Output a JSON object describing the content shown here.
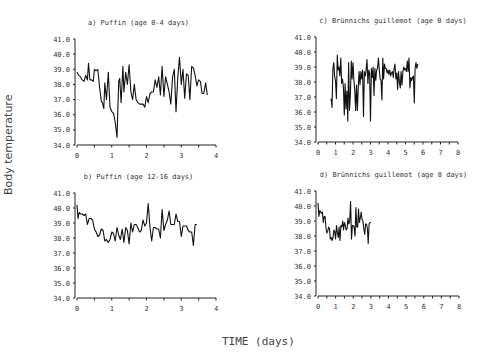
{
  "figure": {
    "ylabel": "Body temperature",
    "xlabel": "TIME (days)"
  },
  "chart_data": [
    {
      "id": "a",
      "type": "line",
      "title": "a) Puffin (age 0-4 days)",
      "xlabel": "TIME (days)",
      "ylabel": "Body temperature",
      "xlim": [
        0,
        4
      ],
      "ylim": [
        34.0,
        41.0
      ],
      "xticks": [
        0,
        1,
        2,
        3,
        4
      ],
      "yticks": [
        "34.0",
        "35.0",
        "36.0",
        "37.0",
        "38.0",
        "39.0",
        "40.0",
        "41.0"
      ],
      "grid": false,
      "box": {
        "x0": 77,
        "x1": 216,
        "y_top": 39,
        "y_bottom": 145
      },
      "x": [
        0.0,
        0.05,
        0.1,
        0.15,
        0.2,
        0.25,
        0.3,
        0.33,
        0.37,
        0.42,
        0.47,
        0.5,
        0.55,
        0.6,
        0.65,
        0.7,
        0.73,
        0.77,
        0.8,
        0.85,
        0.9,
        0.95,
        1.0,
        1.05,
        1.1,
        1.15,
        1.2,
        1.23,
        1.27,
        1.32,
        1.35,
        1.4,
        1.45,
        1.5,
        1.55,
        1.6,
        1.65,
        1.7,
        1.75,
        1.8,
        1.85,
        1.9,
        1.95,
        2.0,
        2.05,
        2.1,
        2.15,
        2.2,
        2.25,
        2.3,
        2.35,
        2.4,
        2.45,
        2.5,
        2.55,
        2.6,
        2.65,
        2.7,
        2.75,
        2.8,
        2.85,
        2.9,
        2.95,
        3.0,
        3.05,
        3.1,
        3.15,
        3.2,
        3.25,
        3.3,
        3.35,
        3.4,
        3.45,
        3.5,
        3.55,
        3.6,
        3.65,
        3.7,
        3.75,
        3.8,
        3.85,
        3.9,
        3.95
      ],
      "values": [
        38.8,
        38.6,
        38.5,
        38.3,
        38.2,
        38.6,
        38.3,
        39.4,
        38.3,
        38.3,
        38.2,
        39.0,
        38.9,
        39.0,
        37.8,
        36.9,
        36.8,
        36.4,
        38.1,
        37.0,
        38.8,
        36.5,
        36.2,
        36.1,
        35.5,
        34.5,
        38.2,
        38.4,
        36.8,
        39.2,
        37.5,
        38.8,
        38.0,
        39.3,
        37.5,
        37.0,
        38.0,
        37.0,
        36.8,
        36.7,
        36.7,
        36.7,
        36.5,
        37.2,
        36.8,
        37.4,
        37.5,
        37.5,
        38.3,
        37.8,
        38.5,
        37.3,
        39.2,
        37.2,
        38.5,
        38.0,
        37.5,
        36.7,
        38.5,
        39.0,
        36.2,
        38.5,
        39.8,
        38.0,
        39.0,
        37.1,
        38.7,
        38.6,
        37.0,
        39.2,
        39.1,
        38.6,
        37.9,
        38.3,
        38.2,
        37.4,
        37.4,
        38.1,
        37.3
      ]
    },
    {
      "id": "b",
      "type": "line",
      "title": "b) Puffin (age 12-16 days)",
      "xlabel": "TIME (days)",
      "ylabel": "Body temperature",
      "xlim": [
        0,
        4
      ],
      "ylim": [
        34.0,
        41.0
      ],
      "xticks": [
        0,
        1,
        2,
        3,
        4
      ],
      "yticks": [
        "34.0",
        "35.0",
        "36.0",
        "37.0",
        "38.0",
        "39.0",
        "40.0",
        "41.0"
      ],
      "grid": false,
      "box": {
        "x0": 77,
        "x1": 216,
        "y_top": 193,
        "y_bottom": 298
      },
      "x": [
        0.0,
        0.03,
        0.06,
        0.1,
        0.15,
        0.2,
        0.25,
        0.3,
        0.35,
        0.4,
        0.45,
        0.5,
        0.55,
        0.6,
        0.65,
        0.7,
        0.75,
        0.8,
        0.85,
        0.9,
        0.95,
        1.0,
        1.05,
        1.1,
        1.15,
        1.2,
        1.25,
        1.3,
        1.35,
        1.4,
        1.45,
        1.5,
        1.55,
        1.6,
        1.65,
        1.7,
        1.75,
        1.8,
        1.85,
        1.9,
        1.95,
        2.0,
        2.05,
        2.1,
        2.15,
        2.2,
        2.25,
        2.3,
        2.35,
        2.4,
        2.45,
        2.5,
        2.55,
        2.6,
        2.65,
        2.7,
        2.75,
        2.8,
        2.85,
        2.9,
        2.95,
        3.0,
        3.05,
        3.1,
        3.15,
        3.2,
        3.25,
        3.3,
        3.35,
        3.4,
        3.45,
        3.5,
        3.55,
        3.6,
        3.65,
        3.7,
        3.75,
        3.8,
        3.85,
        3.9,
        3.95
      ],
      "values": [
        40.2,
        39.3,
        39.7,
        39.6,
        39.6,
        39.5,
        39.6,
        38.9,
        39.3,
        39.3,
        39.2,
        38.6,
        38.4,
        38.1,
        38.2,
        38.6,
        38.5,
        37.8,
        37.9,
        37.7,
        37.9,
        38.4,
        38.3,
        37.8,
        38.7,
        38.2,
        37.9,
        38.6,
        37.7,
        38.7,
        38.5,
        37.6,
        39.0,
        38.4,
        38.9,
        38.9,
        38.7,
        38.4,
        38.5,
        39.2,
        38.8,
        39.0,
        40.3,
        38.7,
        37.8,
        38.7,
        38.7,
        38.6,
        38.6,
        38.0,
        39.9,
        38.5,
        38.9,
        39.2,
        39.8,
        38.9,
        38.9,
        38.9,
        39.6,
        39.1,
        39.1,
        38.1,
        38.8,
        38.8,
        38.8,
        38.5,
        38.4,
        38.4,
        37.5,
        38.9,
        38.9
      ]
    },
    {
      "id": "c",
      "type": "line",
      "title": "c) Brünnichs guillemot (age 0 days)",
      "xlabel": "TIME (days)",
      "ylabel": "Body temperature",
      "xlim": [
        0,
        8
      ],
      "ylim": [
        34.0,
        41.0
      ],
      "xticks": [
        0,
        1,
        2,
        3,
        4,
        5,
        6,
        7,
        8
      ],
      "yticks": [
        "34.0",
        "35.0",
        "36.0",
        "37.0",
        "38.0",
        "39.0",
        "40.0",
        "41.0"
      ],
      "grid": false,
      "box": {
        "x0": 318,
        "x1": 458,
        "y_top": 37,
        "y_bottom": 142
      },
      "x": [
        0.75,
        0.8,
        0.85,
        0.9,
        0.95,
        1.0,
        1.05,
        1.1,
        1.15,
        1.2,
        1.25,
        1.3,
        1.35,
        1.4,
        1.45,
        1.5,
        1.55,
        1.6,
        1.65,
        1.7,
        1.75,
        1.8,
        1.85,
        1.9,
        1.95,
        2.0,
        2.05,
        2.1,
        2.15,
        2.2,
        2.25,
        2.3,
        2.35,
        2.4,
        2.45,
        2.5,
        2.55,
        2.6,
        2.65,
        2.7,
        2.75,
        2.8,
        2.85,
        2.9,
        2.95,
        3.0,
        3.05,
        3.1,
        3.15,
        3.2,
        3.25,
        3.3,
        3.35,
        3.4,
        3.45,
        3.5,
        3.55,
        3.6,
        3.65,
        3.7,
        3.75,
        3.8,
        3.85,
        3.9,
        3.95,
        4.0,
        4.05,
        4.1,
        4.15,
        4.2,
        4.25,
        4.3,
        4.35,
        4.4,
        4.45,
        4.5,
        4.55,
        4.6,
        4.65,
        4.7,
        4.75,
        4.8,
        4.85,
        4.9,
        4.95,
        5.0,
        5.05,
        5.1,
        5.15,
        5.2,
        5.25,
        5.3,
        5.35,
        5.4,
        5.45,
        5.5,
        5.55,
        5.6,
        5.65,
        5.7,
        5.75,
        5.8,
        5.85,
        5.9,
        5.95,
        6.0,
        6.05,
        6.1,
        6.15,
        6.2,
        6.25,
        6.3,
        6.35,
        6.4,
        6.45,
        6.5,
        6.55,
        6.6,
        6.65,
        6.7,
        6.75,
        6.8,
        6.85,
        6.9,
        6.95,
        7.0
      ],
      "values": [
        36.9,
        36.3,
        38.9,
        39.3,
        38.4,
        38.1,
        36.9,
        39.8,
        38.8,
        39.0,
        38.4,
        39.6,
        37.9,
        38.2,
        37.7,
        35.8,
        37.9,
        36.2,
        37.4,
        35.4,
        39.3,
        36.1,
        37.2,
        39.4,
        38.2,
        39.3,
        38.1,
        37.4,
        36.1,
        37.8,
        36.1,
        37.7,
        38.7,
        37.8,
        38.7,
        38.2,
        38.8,
        35.7,
        38.7,
        38.4,
        38.8,
        39.5,
        37.9,
        38.8,
        38.6,
        35.4,
        38.9,
        38.3,
        39.0,
        37.1,
        38.9,
        38.1,
        38.8,
        38.9,
        39.6,
        38.8,
        38.2,
        38.1,
        36.8,
        39.6,
        38.2,
        39.2,
        38.9,
        38.9,
        38.6,
        38.8,
        38.5,
        38.8,
        38.4,
        38.6,
        38.7,
        38.3,
        38.9,
        39.2,
        38.2,
        38.6,
        37.5,
        38.7,
        38.0,
        37.6,
        38.7,
        37.8,
        38.7,
        39.0,
        38.8,
        38.9,
        38.7,
        39.4,
        38.7,
        39.6,
        37.6,
        38.3,
        38.1,
        38.3,
        38.4,
        36.6,
        38.9,
        39.3,
        38.9,
        39.2
      ]
    },
    {
      "id": "d",
      "type": "line",
      "title": "d) Brünnichs guillemot (age 8 days)",
      "xlabel": "TIME (days)",
      "ylabel": "Body temperature",
      "xlim": [
        0,
        8
      ],
      "ylim": [
        34.0,
        41.0
      ],
      "xticks": [
        0,
        1,
        2,
        3,
        4,
        5,
        6,
        7,
        8
      ],
      "yticks": [
        "34.0",
        "35.0",
        "36.0",
        "37.0",
        "38.0",
        "39.0",
        "40.0",
        "41.0"
      ],
      "grid": false,
      "box": {
        "x0": 318,
        "x1": 459,
        "y_top": 191,
        "y_bottom": 296
      },
      "x": [
        0.0,
        0.05,
        0.1,
        0.15,
        0.2,
        0.25,
        0.3,
        0.35,
        0.4,
        0.45,
        0.5,
        0.55,
        0.6,
        0.65,
        0.7,
        0.75,
        0.8,
        0.85,
        0.9,
        0.95,
        1.0,
        1.05,
        1.1,
        1.15,
        1.2,
        1.25,
        1.3,
        1.35,
        1.4,
        1.45,
        1.5,
        1.55,
        1.6,
        1.65,
        1.7,
        1.75,
        1.8,
        1.85,
        1.9,
        1.95,
        2.0,
        2.05,
        2.1,
        2.15,
        2.2,
        2.25,
        2.3,
        2.35,
        2.4,
        2.45,
        2.5,
        2.55,
        2.6,
        2.65,
        2.7,
        2.75,
        2.8,
        2.85,
        2.9,
        2.95,
        3.0,
        3.05,
        3.1,
        3.15,
        3.2,
        3.25,
        3.3,
        3.35,
        3.4,
        3.45,
        3.5,
        3.55,
        3.6,
        3.65,
        3.7,
        3.75,
        3.8,
        3.85,
        3.9,
        3.95,
        4.0
      ],
      "values": [
        40.2,
        39.3,
        39.7,
        39.6,
        39.5,
        39.6,
        38.9,
        39.3,
        39.3,
        38.6,
        38.2,
        38.3,
        38.6,
        38.5,
        37.8,
        37.9,
        37.7,
        37.9,
        38.4,
        38.3,
        37.8,
        38.7,
        38.2,
        37.9,
        38.6,
        37.7,
        38.7,
        38.6,
        39.0,
        38.4,
        38.9,
        38.7,
        38.4,
        38.5,
        39.2,
        38.8,
        39.0,
        40.3,
        37.8,
        38.7,
        38.7,
        38.6,
        38.0,
        39.9,
        38.6,
        38.6,
        39.8,
        38.9,
        39.2,
        39.6,
        39.1,
        39.0,
        38.5,
        38.1,
        38.8,
        38.8,
        38.5,
        37.5,
        38.8,
        38.9,
        38.9
      ]
    }
  ]
}
